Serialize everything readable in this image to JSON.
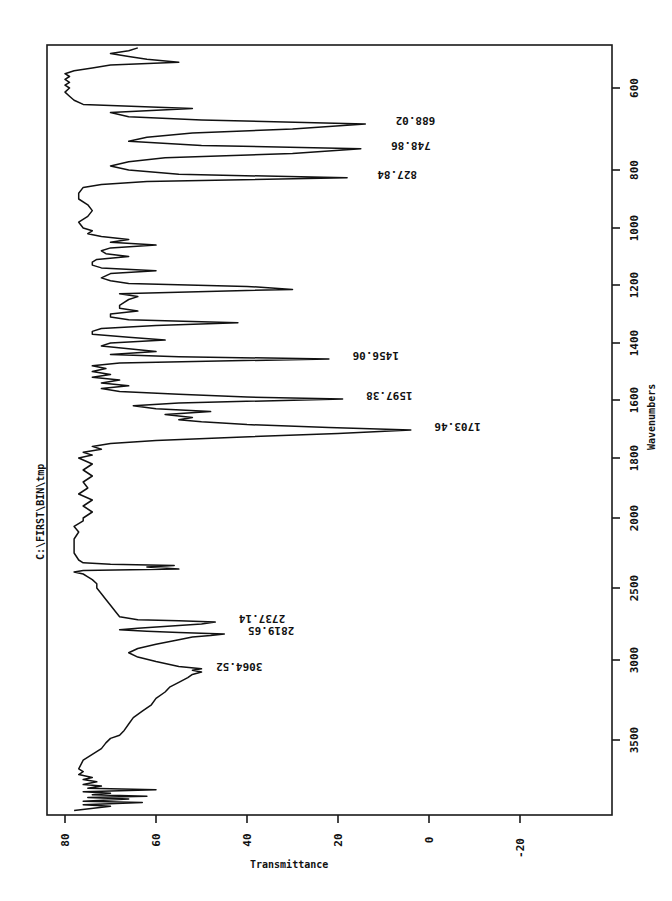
{
  "chart_data": {
    "type": "line",
    "title": "C:\\FIRST\\BIN\\tmp",
    "xlabel": "Wavenumbers",
    "ylabel": "Transmittance",
    "orientation": "rotated-90-clockwise",
    "x_ticks": [
      600,
      800,
      1000,
      1200,
      1400,
      1600,
      1800,
      2000,
      2500,
      3000,
      3500
    ],
    "y_ticks": [
      80,
      60,
      40,
      20,
      0,
      -20
    ],
    "xlim": [
      4000,
      450
    ],
    "ylim": [
      -30,
      82
    ],
    "grid": false,
    "legend": null,
    "peak_labels": [
      {
        "x": 688.02,
        "label": "688.02",
        "y": 14
      },
      {
        "x": 748.86,
        "label": "748.86",
        "y": 15
      },
      {
        "x": 827.84,
        "label": "827.84",
        "y": 18
      },
      {
        "x": 1456.06,
        "label": "1456.06",
        "y": 22
      },
      {
        "x": 1597.38,
        "label": "1597.38",
        "y": 19
      },
      {
        "x": 1703.46,
        "label": "1703.46",
        "y": 4
      },
      {
        "x": 2737.14,
        "label": "2737.14",
        "y": 47
      },
      {
        "x": 2819.65,
        "label": "2819.65",
        "y": 45
      },
      {
        "x": 3064.52,
        "label": "3064.52",
        "y": 52
      }
    ],
    "series": [
      {
        "name": "spectrum",
        "points": [
          [
            3990,
            78
          ],
          [
            3960,
            70
          ],
          [
            3950,
            76
          ],
          [
            3935,
            63
          ],
          [
            3925,
            76
          ],
          [
            3910,
            66
          ],
          [
            3900,
            75
          ],
          [
            3890,
            62
          ],
          [
            3880,
            74
          ],
          [
            3870,
            70
          ],
          [
            3860,
            76
          ],
          [
            3845,
            60
          ],
          [
            3835,
            75
          ],
          [
            3820,
            72
          ],
          [
            3810,
            76
          ],
          [
            3790,
            73
          ],
          [
            3775,
            76
          ],
          [
            3760,
            74
          ],
          [
            3740,
            77
          ],
          [
            3720,
            76
          ],
          [
            3700,
            77
          ],
          [
            3640,
            76
          ],
          [
            3600,
            74
          ],
          [
            3560,
            72
          ],
          [
            3520,
            71
          ],
          [
            3490,
            70
          ],
          [
            3470,
            68
          ],
          [
            3440,
            67
          ],
          [
            3400,
            66
          ],
          [
            3360,
            65
          ],
          [
            3320,
            63
          ],
          [
            3280,
            61
          ],
          [
            3240,
            60
          ],
          [
            3200,
            58
          ],
          [
            3170,
            57
          ],
          [
            3140,
            55
          ],
          [
            3110,
            53
          ],
          [
            3090,
            52
          ],
          [
            3075,
            50
          ],
          [
            3064,
            52
          ],
          [
            3055,
            50
          ],
          [
            3040,
            55
          ],
          [
            3010,
            60
          ],
          [
            2980,
            64
          ],
          [
            2950,
            66
          ],
          [
            2920,
            64
          ],
          [
            2890,
            60
          ],
          [
            2860,
            55
          ],
          [
            2840,
            52
          ],
          [
            2830,
            48
          ],
          [
            2819,
            45
          ],
          [
            2810,
            55
          ],
          [
            2800,
            62
          ],
          [
            2790,
            68
          ],
          [
            2780,
            64
          ],
          [
            2760,
            55
          ],
          [
            2750,
            50
          ],
          [
            2737,
            47
          ],
          [
            2728,
            55
          ],
          [
            2720,
            64
          ],
          [
            2700,
            68
          ],
          [
            2660,
            69
          ],
          [
            2620,
            70
          ],
          [
            2580,
            71
          ],
          [
            2540,
            72
          ],
          [
            2500,
            73
          ],
          [
            2470,
            73
          ],
          [
            2440,
            74
          ],
          [
            2420,
            75
          ],
          [
            2400,
            76
          ],
          [
            2385,
            78
          ],
          [
            2375,
            76
          ],
          [
            2365,
            55
          ],
          [
            2350,
            62
          ],
          [
            2340,
            56
          ],
          [
            2330,
            70
          ],
          [
            2320,
            76
          ],
          [
            2300,
            77
          ],
          [
            2250,
            78
          ],
          [
            2200,
            78
          ],
          [
            2150,
            78
          ],
          [
            2100,
            77
          ],
          [
            2060,
            78
          ],
          [
            2020,
            76
          ],
          [
            2000,
            76
          ],
          [
            1980,
            74
          ],
          [
            1960,
            76
          ],
          [
            1940,
            74
          ],
          [
            1920,
            77
          ],
          [
            1900,
            75
          ],
          [
            1880,
            76
          ],
          [
            1860,
            74
          ],
          [
            1840,
            76
          ],
          [
            1820,
            74
          ],
          [
            1800,
            77
          ],
          [
            1790,
            74
          ],
          [
            1780,
            76
          ],
          [
            1770,
            72
          ],
          [
            1760,
            74
          ],
          [
            1750,
            70
          ],
          [
            1740,
            60
          ],
          [
            1730,
            45
          ],
          [
            1715,
            20
          ],
          [
            1703,
            4
          ],
          [
            1695,
            22
          ],
          [
            1685,
            40
          ],
          [
            1675,
            50
          ],
          [
            1668,
            55
          ],
          [
            1660,
            52
          ],
          [
            1650,
            58
          ],
          [
            1640,
            48
          ],
          [
            1630,
            60
          ],
          [
            1620,
            65
          ],
          [
            1610,
            55
          ],
          [
            1597,
            19
          ],
          [
            1590,
            40
          ],
          [
            1580,
            55
          ],
          [
            1570,
            68
          ],
          [
            1560,
            72
          ],
          [
            1550,
            66
          ],
          [
            1540,
            72
          ],
          [
            1530,
            68
          ],
          [
            1520,
            74
          ],
          [
            1510,
            70
          ],
          [
            1500,
            74
          ],
          [
            1490,
            71
          ],
          [
            1480,
            74
          ],
          [
            1470,
            68
          ],
          [
            1456,
            22
          ],
          [
            1448,
            55
          ],
          [
            1440,
            70
          ],
          [
            1430,
            60
          ],
          [
            1420,
            66
          ],
          [
            1410,
            72
          ],
          [
            1400,
            70
          ],
          [
            1390,
            58
          ],
          [
            1380,
            66
          ],
          [
            1370,
            74
          ],
          [
            1360,
            74
          ],
          [
            1350,
            72
          ],
          [
            1340,
            60
          ],
          [
            1330,
            42
          ],
          [
            1320,
            66
          ],
          [
            1310,
            70
          ],
          [
            1300,
            70
          ],
          [
            1290,
            64
          ],
          [
            1280,
            68
          ],
          [
            1270,
            68
          ],
          [
            1260,
            67
          ],
          [
            1250,
            66
          ],
          [
            1240,
            64
          ],
          [
            1230,
            68
          ],
          [
            1215,
            30
          ],
          [
            1205,
            40
          ],
          [
            1195,
            66
          ],
          [
            1185,
            70
          ],
          [
            1175,
            72
          ],
          [
            1160,
            70
          ],
          [
            1150,
            60
          ],
          [
            1140,
            72
          ],
          [
            1130,
            74
          ],
          [
            1120,
            74
          ],
          [
            1110,
            73
          ],
          [
            1100,
            66
          ],
          [
            1090,
            71
          ],
          [
            1080,
            72
          ],
          [
            1070,
            70
          ],
          [
            1060,
            60
          ],
          [
            1050,
            70
          ],
          [
            1040,
            66
          ],
          [
            1030,
            72
          ],
          [
            1020,
            75
          ],
          [
            1010,
            74
          ],
          [
            1000,
            76
          ],
          [
            980,
            77
          ],
          [
            960,
            75
          ],
          [
            940,
            74
          ],
          [
            920,
            75
          ],
          [
            900,
            77
          ],
          [
            880,
            77
          ],
          [
            860,
            76
          ],
          [
            850,
            72
          ],
          [
            840,
            62
          ],
          [
            827,
            18
          ],
          [
            815,
            55
          ],
          [
            800,
            66
          ],
          [
            790,
            70
          ],
          [
            780,
            66
          ],
          [
            770,
            58
          ],
          [
            760,
            30
          ],
          [
            748,
            15
          ],
          [
            740,
            50
          ],
          [
            730,
            66
          ],
          [
            720,
            62
          ],
          [
            710,
            52
          ],
          [
            700,
            30
          ],
          [
            688,
            14
          ],
          [
            678,
            50
          ],
          [
            670,
            66
          ],
          [
            660,
            70
          ],
          [
            650,
            52
          ],
          [
            640,
            76
          ],
          [
            630,
            78
          ],
          [
            620,
            79
          ],
          [
            610,
            80
          ],
          [
            600,
            79
          ],
          [
            590,
            80
          ],
          [
            580,
            79
          ],
          [
            570,
            80
          ],
          [
            560,
            79
          ],
          [
            550,
            80
          ],
          [
            540,
            78
          ],
          [
            530,
            74
          ],
          [
            520,
            70
          ],
          [
            510,
            55
          ],
          [
            500,
            62
          ],
          [
            490,
            66
          ],
          [
            480,
            70
          ],
          [
            470,
            66
          ],
          [
            460,
            64
          ]
        ]
      }
    ]
  }
}
